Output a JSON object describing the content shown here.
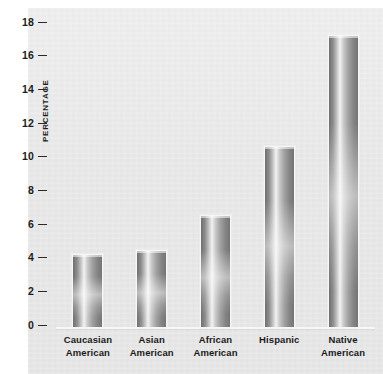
{
  "chart_data": {
    "type": "bar",
    "title": "",
    "xlabel": "",
    "ylabel": "PERCENTAGE",
    "ylim": [
      0,
      18
    ],
    "yticks": [
      0,
      2,
      4,
      6,
      8,
      10,
      12,
      14,
      16,
      18
    ],
    "ytick_labels": [
      "0",
      "2",
      "4",
      "6",
      "8",
      "10",
      "12",
      "14",
      "16",
      "18"
    ],
    "grid": false,
    "legend": null,
    "categories": [
      "Caucasian American",
      "Asian American",
      "African American",
      "Hispanic",
      "Native American"
    ],
    "category_lines": [
      [
        "Caucasian",
        "American"
      ],
      [
        "Asian",
        "American"
      ],
      [
        "African",
        "American"
      ],
      [
        "Hispanic",
        ""
      ],
      [
        "Native",
        "American"
      ]
    ],
    "values": [
      4.25,
      4.5,
      6.6,
      10.7,
      17.3
    ],
    "bars": [
      {
        "label": "Caucasian American",
        "value": 4.25
      },
      {
        "label": "Asian American",
        "value": 4.5
      },
      {
        "label": "African American",
        "value": 6.6
      },
      {
        "label": "Hispanic",
        "value": 10.7
      },
      {
        "label": "Native American",
        "value": 17.3
      }
    ]
  },
  "colors": {
    "panel_background": "#e9e9e9",
    "bar_dark": "#6f6f6f",
    "bar_highlight": "#f2f2f2",
    "axis_text": "#1c1c1c",
    "baseline": "#f7f7f7"
  }
}
